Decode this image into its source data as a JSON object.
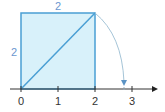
{
  "diagram": {
    "square": {
      "side_top_label": "2",
      "side_left_label": "2",
      "fill": "#d8f1fa",
      "stroke": "#4a9fd4"
    },
    "number_line": {
      "ticks": [
        "0",
        "1",
        "2",
        "3"
      ],
      "axis_color": "#333333"
    },
    "arc": {
      "color": "#8fb4cc",
      "arrow_color": "#5b93c4"
    },
    "label_color": "#6b97cf"
  }
}
